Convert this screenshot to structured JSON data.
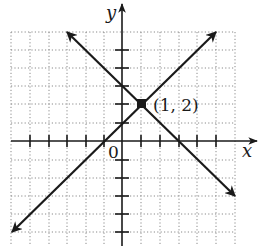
{
  "figure": {
    "axis_labels": {
      "x": "x",
      "y": "y"
    },
    "origin_label": "0",
    "point_label": "(1, 2)",
    "intersection_point": {
      "x": 1,
      "y": 2
    },
    "lines": [
      {
        "name": "increasing-line",
        "slope": 1,
        "intercept": 1,
        "equation": "y = x + 1"
      },
      {
        "name": "decreasing-line",
        "slope": -1,
        "intercept": 3,
        "equation": "y = -x + 3"
      }
    ],
    "grid": {
      "x_range": [
        -6,
        6
      ],
      "y_range": [
        -5,
        6
      ],
      "unit_px": 18.7
    },
    "colors": {
      "ink": "#1a1a1a",
      "grid": "#8a8a8a",
      "background": "#ffffff"
    }
  }
}
